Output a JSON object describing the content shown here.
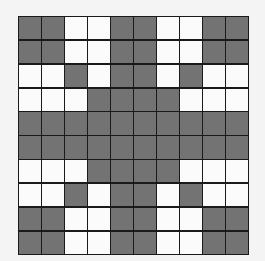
{
  "grid": {
    "rows": 10,
    "cols": 10,
    "colors": {
      "dark": "#737373",
      "light": "#fbfbfb",
      "line": "#1a1a1a",
      "background": "#f4f4f4"
    },
    "cells": [
      [
        1,
        1,
        0,
        0,
        1,
        1,
        0,
        0,
        1,
        1
      ],
      [
        1,
        1,
        0,
        0,
        1,
        1,
        0,
        0,
        1,
        1
      ],
      [
        0,
        0,
        1,
        0,
        1,
        1,
        0,
        1,
        0,
        0
      ],
      [
        0,
        0,
        0,
        1,
        1,
        1,
        1,
        0,
        0,
        0
      ],
      [
        1,
        1,
        1,
        1,
        1,
        1,
        1,
        1,
        1,
        1
      ],
      [
        1,
        1,
        1,
        1,
        1,
        1,
        1,
        1,
        1,
        1
      ],
      [
        0,
        0,
        0,
        1,
        1,
        1,
        1,
        0,
        0,
        0
      ],
      [
        0,
        0,
        1,
        0,
        1,
        1,
        0,
        1,
        0,
        0
      ],
      [
        1,
        1,
        0,
        0,
        1,
        1,
        0,
        0,
        1,
        1
      ],
      [
        1,
        1,
        0,
        0,
        1,
        1,
        0,
        0,
        1,
        1
      ]
    ]
  }
}
